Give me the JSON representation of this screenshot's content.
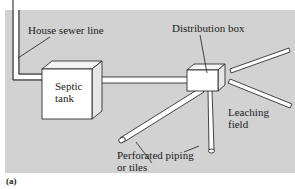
{
  "figure": {
    "caption": "(a)",
    "background_color": "#d2d2d2",
    "labels": {
      "house_sewer_line": "House sewer line",
      "septic_tank_line1": "Septic",
      "septic_tank_line2": "tank",
      "distribution_box": "Distribution box",
      "leaching_field_line1": "Leaching",
      "leaching_field_line2": "field",
      "perforated_line1": "Perforated piping",
      "perforated_line2": "or tiles"
    }
  }
}
